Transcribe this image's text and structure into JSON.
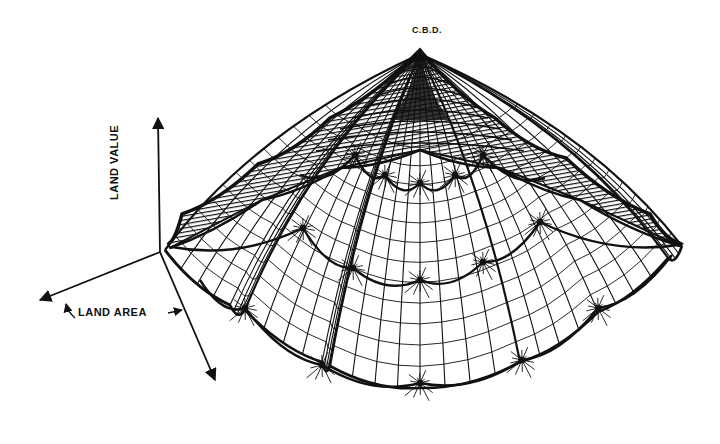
{
  "diagram": {
    "peak_label": "C.B.D.",
    "axes": {
      "vertical_label": "LAND VALUE",
      "horizontal_label": "LAND AREA"
    },
    "colors": {
      "ink": "#111111",
      "paper": "#ffffff"
    },
    "peak": [
      420,
      50
    ],
    "origin": [
      160,
      252
    ],
    "axis_lines": [
      {
        "name": "land-value-axis",
        "from": [
          160,
          252
        ],
        "to": [
          158,
          118
        ]
      },
      {
        "name": "land-area-axis-left",
        "from": [
          160,
          252
        ],
        "to": [
          40,
          300
        ]
      },
      {
        "name": "land-area-axis-right",
        "from": [
          160,
          252
        ],
        "to": [
          215,
          380
        ]
      }
    ],
    "rim_upper": [
      [
        168,
        244
      ],
      [
        182,
        214
      ],
      [
        258,
        164
      ],
      [
        330,
        118
      ],
      [
        420,
        50
      ],
      [
        495,
        118
      ],
      [
        566,
        158
      ],
      [
        650,
        214
      ],
      [
        682,
        244
      ]
    ],
    "rim_lower": [
      [
        170,
        248
      ],
      [
        262,
        200
      ],
      [
        340,
        168
      ],
      [
        420,
        150
      ],
      [
        500,
        168
      ],
      [
        580,
        200
      ],
      [
        680,
        246
      ]
    ],
    "outer_boundary": [
      [
        165,
        250
      ],
      [
        230,
        305
      ],
      [
        245,
        310
      ],
      [
        322,
        362
      ],
      [
        330,
        366
      ],
      [
        420,
        388
      ],
      [
        520,
        362
      ],
      [
        598,
        312
      ],
      [
        668,
        258
      ],
      [
        682,
        246
      ]
    ],
    "rings": [
      [
        [
          172,
          247
        ],
        [
          303,
          228
        ],
        [
          353,
          268
        ],
        [
          420,
          280
        ],
        [
          483,
          262
        ],
        [
          540,
          222
        ],
        [
          678,
          245
        ]
      ],
      [
        [
          200,
          280
        ],
        [
          245,
          308
        ],
        [
          322,
          365
        ],
        [
          420,
          383
        ],
        [
          522,
          360
        ],
        [
          598,
          308
        ],
        [
          672,
          255
        ]
      ],
      [
        [
          300,
          175
        ],
        [
          355,
          155
        ],
        [
          385,
          175
        ],
        [
          420,
          183
        ],
        [
          455,
          175
        ],
        [
          483,
          155
        ],
        [
          545,
          178
        ]
      ]
    ],
    "hubs": [
      [
        355,
        155
      ],
      [
        385,
        175
      ],
      [
        420,
        183
      ],
      [
        455,
        175
      ],
      [
        483,
        155
      ],
      [
        303,
        228
      ],
      [
        353,
        268
      ],
      [
        420,
        280
      ],
      [
        483,
        262
      ],
      [
        540,
        222
      ],
      [
        245,
        308
      ],
      [
        322,
        365
      ],
      [
        420,
        383
      ],
      [
        522,
        360
      ],
      [
        598,
        308
      ]
    ]
  }
}
